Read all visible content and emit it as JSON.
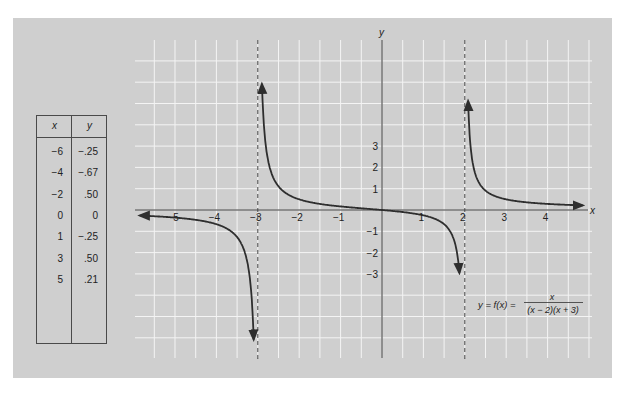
{
  "chart_data": {
    "type": "line",
    "title": "",
    "function_label": "y = f(x) =",
    "numerator": "x",
    "denominator": "(x − 2)(x + 3)",
    "formula": "y = f(x) = x / ((x − 2)(x + 3))",
    "xlabel": "x",
    "ylabel": "y",
    "x_ticks": [
      -5,
      -4,
      -3,
      -2,
      -1,
      1,
      2,
      3,
      4
    ],
    "x_tick_labels": [
      "−5",
      "−4",
      "−3",
      "−2",
      "−1",
      "1",
      "2",
      "3",
      "4"
    ],
    "y_ticks": [
      3,
      2,
      1,
      -1,
      -2,
      -3
    ],
    "y_tick_labels": [
      "3",
      "2",
      "1",
      "−1",
      "−2",
      "−3"
    ],
    "xlim": [
      -5.8,
      4.9
    ],
    "ylim": [
      -7,
      8
    ],
    "grid": true,
    "vertical_asymptotes": [
      -3,
      2
    ],
    "horizontal_asymptote": 0,
    "branches": [
      {
        "name": "left",
        "domain": [
          -5.85,
          -3.1
        ]
      },
      {
        "name": "middle",
        "domain": [
          -2.9,
          1.87
        ]
      },
      {
        "name": "right",
        "domain": [
          2.08,
          4.85
        ]
      }
    ],
    "table": {
      "columns": [
        "x",
        "y"
      ],
      "rows": [
        [
          "−6",
          "−.25"
        ],
        [
          "−4",
          "−.67"
        ],
        [
          "−2",
          ".50"
        ],
        [
          "0",
          "0"
        ],
        [
          "1",
          "−.25"
        ],
        [
          "3",
          ".50"
        ],
        [
          "5",
          ".21"
        ]
      ]
    },
    "colors": {
      "panel": "#cfcfcf",
      "grid": "#f4f4f4",
      "axis": "#3a3a3a",
      "curve": "#2e2e2e"
    }
  }
}
